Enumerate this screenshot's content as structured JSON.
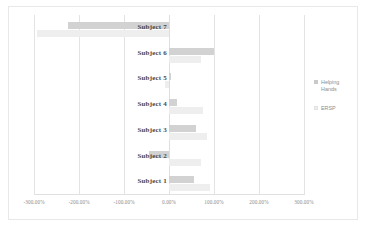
{
  "chart_data": {
    "type": "bar",
    "orientation": "horizontal",
    "title": "",
    "xlabel": "",
    "ylabel": "",
    "categories": [
      "Subject 1",
      "Subject 2",
      "Subject 3",
      "Subject 4",
      "Subject 5",
      "Subject 6",
      "Subject 7"
    ],
    "series": [
      {
        "name": "Helping Hands",
        "color": "#d2d2d2",
        "values": [
          55,
          -45,
          60,
          18,
          5,
          100,
          -225
        ]
      },
      {
        "name": "ERSP",
        "color": "#eeeeee",
        "values": [
          90,
          70,
          85,
          75,
          -8,
          72,
          -293
        ]
      }
    ],
    "xticks": [
      -300,
      -200,
      -100,
      0,
      100,
      200,
      300
    ],
    "xtick_labels": [
      "-300.00%",
      "-200.00%",
      "-100.00%",
      "0.00%",
      "100.00%",
      "200.00%",
      "300.00%"
    ],
    "xlim": [
      -300,
      300
    ],
    "grid": true,
    "legend_position": "right"
  },
  "legend": {
    "entries": [
      {
        "label_line1": "Helping",
        "label_line2": "Hands"
      },
      {
        "label_line1": "ERSP",
        "label_line2": ""
      }
    ]
  }
}
